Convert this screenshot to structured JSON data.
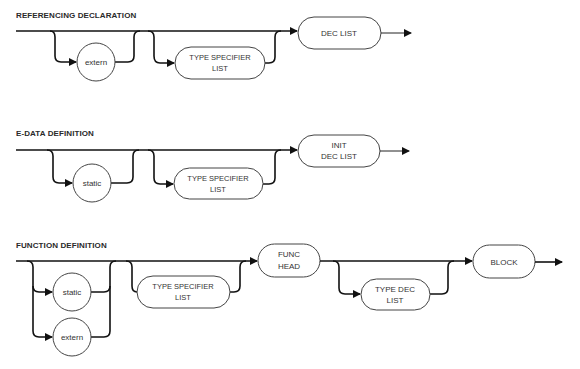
{
  "diagrams": [
    {
      "title": "REFERENCING DECLARATION",
      "optional_1": "extern",
      "optional_2": {
        "line1": "TYPE SPECIFIER",
        "line2": "LIST"
      },
      "required": {
        "line1": "DEC LIST"
      }
    },
    {
      "title": "E-DATA DEFINITION",
      "optional_1": "static",
      "optional_2": {
        "line1": "TYPE SPECIFIER",
        "line2": "LIST"
      },
      "required": {
        "line1": "INIT",
        "line2": "DEC LIST"
      }
    },
    {
      "title": "FUNCTION DEFINITION",
      "choice_1": "static",
      "choice_2": "extern",
      "optional_2": {
        "line1": "TYPE SPECIFIER",
        "line2": "LIST"
      },
      "func_head": {
        "line1": "FUNC",
        "line2": "HEAD"
      },
      "optional_3": {
        "line1": "TYPE DEC",
        "line2": "LIST"
      },
      "block": "BLOCK"
    }
  ],
  "colors": {
    "line": "#111111",
    "node_stroke": "#444444",
    "text": "#333333",
    "background": "#ffffff"
  }
}
